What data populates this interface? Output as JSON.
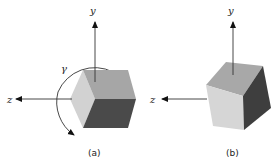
{
  "figure": {
    "panels": [
      {
        "id": "a",
        "caption": "(a)",
        "axes": {
          "y_label": "y",
          "z_label": "z"
        },
        "rotation_label": "γ",
        "faces": {
          "top": "#a6a6a6",
          "left": "#d2d2d2",
          "right": "#4a4a4a"
        }
      },
      {
        "id": "b",
        "caption": "(b)",
        "axes": {
          "y_label": "y",
          "z_label": "z"
        },
        "faces": {
          "top": "#a8a8a8",
          "left": "#d6d6d6",
          "right": "#3e3e3e"
        }
      }
    ],
    "colors": {
      "axis": "#333333",
      "background": "#ffffff"
    }
  }
}
